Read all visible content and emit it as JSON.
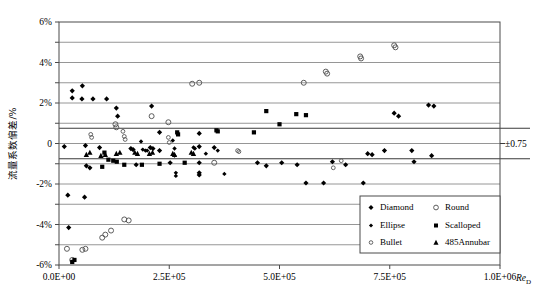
{
  "chart_data": {
    "type": "scatter",
    "title": "",
    "xlabel": "Re_D",
    "ylabel": "流量系数偏差/%",
    "xlim": [
      0,
      1000000
    ],
    "ylim": [
      -6,
      6
    ],
    "grid": true,
    "x_ticks": [
      0,
      250000,
      500000,
      750000,
      1000000
    ],
    "x_tick_labels": [
      "0.0E+00",
      "2.5E+05",
      "5.0E+05",
      "7.5E+05",
      "1.0E+06"
    ],
    "y_ticks": [
      -6,
      -5,
      -4,
      -3,
      -2,
      -1,
      0,
      1,
      2,
      3,
      4,
      5,
      6
    ],
    "y_tick_labels": [
      "-6%",
      "",
      "-4%",
      "",
      "-2%",
      "",
      "0",
      "",
      "2%",
      "",
      "4%",
      "",
      "6%"
    ],
    "legend_position": "bottom-right",
    "annotations": [
      {
        "text": "±0.75",
        "x": 1000000,
        "y": 0,
        "note": "tolerance band label"
      }
    ],
    "reference_lines": [
      {
        "y": 0.75,
        "style": "solid-bold"
      },
      {
        "y": -0.75,
        "style": "solid-bold"
      }
    ],
    "series": [
      {
        "name": "Diamond",
        "marker": "filled-diamond",
        "color": "#000000",
        "points": [
          [
            30000,
            2.6
          ],
          [
            30000,
            2.25
          ],
          [
            53000,
            2.85
          ],
          [
            52000,
            2.2
          ],
          [
            77000,
            2.2
          ],
          [
            108000,
            2.2
          ],
          [
            130000,
            1.75
          ],
          [
            133000,
            1.35
          ],
          [
            210000,
            1.85
          ],
          [
            12000,
            -0.15
          ],
          [
            60000,
            -0.1
          ],
          [
            92000,
            -0.2
          ],
          [
            163000,
            -0.25
          ],
          [
            168000,
            -0.3
          ],
          [
            207000,
            -0.2
          ],
          [
            213000,
            -0.25
          ],
          [
            62000,
            -1.1
          ],
          [
            70000,
            -1.2
          ],
          [
            175000,
            -1.05
          ],
          [
            228000,
            0.55
          ],
          [
            228000,
            -0.35
          ],
          [
            252000,
            -0.95
          ],
          [
            318000,
            0.5
          ],
          [
            318000,
            -0.15
          ],
          [
            318000,
            -0.95
          ],
          [
            318000,
            -1.45
          ],
          [
            318000,
            -1.55
          ],
          [
            352000,
            -0.2
          ],
          [
            20000,
            -2.55
          ],
          [
            58000,
            -2.65
          ],
          [
            22000,
            -4.15
          ],
          [
            450000,
            -0.95
          ],
          [
            470000,
            -1.1
          ],
          [
            505000,
            -0.95
          ],
          [
            540000,
            -1.05
          ],
          [
            560000,
            -1.95
          ],
          [
            600000,
            -1.95
          ],
          [
            620000,
            -0.9
          ],
          [
            650000,
            -1.05
          ],
          [
            690000,
            -1.95
          ],
          [
            700000,
            -0.5
          ],
          [
            710000,
            -0.55
          ],
          [
            738000,
            -0.35
          ],
          [
            760000,
            1.5
          ],
          [
            770000,
            1.35
          ],
          [
            800000,
            -0.35
          ],
          [
            805000,
            -0.9
          ],
          [
            838000,
            1.9
          ],
          [
            850000,
            1.85
          ],
          [
            845000,
            -0.6
          ]
        ]
      },
      {
        "name": "Ellipse",
        "marker": "filled-diamond-small",
        "color": "#000000",
        "points": [
          [
            186000,
            0.1
          ],
          [
            190000,
            -0.3
          ],
          [
            196000,
            -0.35
          ],
          [
            200000,
            -0.35
          ],
          [
            258000,
            0.15
          ],
          [
            262000,
            -0.25
          ],
          [
            262000,
            -0.6
          ],
          [
            265000,
            -1.45
          ],
          [
            265000,
            -1.6
          ],
          [
            305000,
            -0.2
          ],
          [
            308000,
            -0.25
          ],
          [
            333000,
            -0.5
          ],
          [
            360000,
            -0.35
          ],
          [
            375000,
            -1.5
          ]
        ]
      },
      {
        "name": "Bullet",
        "marker": "small-open-dot",
        "color": "#555555",
        "points": [
          [
            72000,
            0.45
          ],
          [
            74000,
            0.3
          ],
          [
            145000,
            0.6
          ],
          [
            148000,
            0.35
          ],
          [
            150000,
            0.2
          ],
          [
            248000,
            0.3
          ],
          [
            250000,
            0.05
          ],
          [
            405000,
            -0.35
          ],
          [
            408000,
            -0.4
          ],
          [
            622000,
            -1.2
          ],
          [
            640000,
            -0.85
          ]
        ]
      },
      {
        "name": "Round",
        "marker": "open-circle",
        "color": "#555555",
        "points": [
          [
            128000,
            0.95
          ],
          [
            130000,
            0.8
          ],
          [
            210000,
            1.35
          ],
          [
            248000,
            1.05
          ],
          [
            302000,
            2.95
          ],
          [
            318000,
            3.0
          ],
          [
            555000,
            3.0
          ],
          [
            605000,
            3.55
          ],
          [
            608000,
            3.45
          ],
          [
            683000,
            4.3
          ],
          [
            685000,
            4.2
          ],
          [
            760000,
            4.85
          ],
          [
            763000,
            4.75
          ],
          [
            148000,
            -3.75
          ],
          [
            158000,
            -3.8
          ],
          [
            105000,
            -4.5
          ],
          [
            118000,
            -4.3
          ],
          [
            98000,
            -4.65
          ],
          [
            18000,
            -5.2
          ],
          [
            53000,
            -5.25
          ],
          [
            60000,
            -5.2
          ],
          [
            30000,
            -5.75
          ],
          [
            352000,
            -0.95
          ]
        ]
      },
      {
        "name": "Scalloped",
        "marker": "filled-square",
        "color": "#000000",
        "points": [
          [
            103000,
            -0.45
          ],
          [
            112000,
            -0.8
          ],
          [
            123000,
            -0.85
          ],
          [
            131000,
            -0.9
          ],
          [
            98000,
            -1.15
          ],
          [
            148000,
            -1.05
          ],
          [
            188000,
            -1.05
          ],
          [
            228000,
            -1.0
          ],
          [
            285000,
            -0.95
          ],
          [
            357000,
            0.65
          ],
          [
            360000,
            0.6
          ],
          [
            268000,
            0.55
          ],
          [
            270000,
            0.45
          ],
          [
            442000,
            0.55
          ],
          [
            470000,
            1.6
          ],
          [
            500000,
            0.95
          ],
          [
            538000,
            1.45
          ],
          [
            560000,
            1.4
          ],
          [
            30000,
            -5.85
          ],
          [
            35000,
            -5.75
          ]
        ]
      },
      {
        "name": "485Annubar",
        "marker": "filled-triangle",
        "color": "#000000",
        "points": [
          [
            62000,
            -0.55
          ],
          [
            70000,
            -0.45
          ],
          [
            95000,
            -0.6
          ],
          [
            105000,
            -0.55
          ],
          [
            130000,
            -0.5
          ],
          [
            138000,
            -0.45
          ],
          [
            172000,
            -0.45
          ],
          [
            178000,
            -0.5
          ],
          [
            205000,
            -0.5
          ],
          [
            212000,
            -0.45
          ],
          [
            258000,
            -0.5
          ],
          [
            262000,
            -0.55
          ],
          [
            300000,
            -0.45
          ],
          [
            305000,
            -0.5
          ]
        ]
      }
    ]
  },
  "legend": {
    "items": [
      {
        "label": "Diamond",
        "marker": "filled-diamond"
      },
      {
        "label": "Ellipse",
        "marker": "filled-diamond-small"
      },
      {
        "label": "Bullet",
        "marker": "small-open-dot"
      },
      {
        "label": "Round",
        "marker": "open-circle"
      },
      {
        "label": "Scalloped",
        "marker": "filled-square"
      },
      {
        "label": "485Annubar",
        "marker": "filled-triangle"
      }
    ]
  },
  "axes": {
    "x_title_main": "Re",
    "x_title_sub": "D",
    "y_title": "流量系数偏差/%",
    "x_labels": [
      "0.0E+00",
      "2.5E+05",
      "5.0E+05",
      "7.5E+05",
      "1.0E+06"
    ],
    "y_labels": [
      "6%",
      "4%",
      "2%",
      "0",
      "-2%",
      "-4%",
      "-6%"
    ]
  },
  "annotation": {
    "tolerance_label": "±0.75"
  },
  "colors": {
    "frame": "#4a4a4a",
    "grid": "#8a8a8a",
    "marker_fill": "#000000",
    "marker_open": "#555555",
    "background": "#ffffff"
  }
}
